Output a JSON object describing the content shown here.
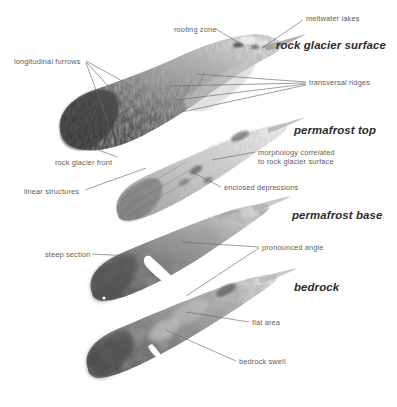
{
  "figure": {
    "width": 397,
    "height": 407,
    "background": "#ffffff",
    "leader_color": "#6b6b6b",
    "annotation_color": "#5d5d5d",
    "title_color": "#2b2b2b"
  },
  "layers": [
    {
      "id": "rock-glacier-surface",
      "label": "rock glacier surface",
      "x": 276,
      "y": 39
    },
    {
      "id": "permafrost-top",
      "label": "permafrost top",
      "x": 294,
      "y": 124
    },
    {
      "id": "permafrost-base",
      "label": "permafrost base",
      "x": 292,
      "y": 209
    },
    {
      "id": "bedrock",
      "label": "bedrock",
      "x": 294,
      "y": 281
    }
  ],
  "annotations": [
    {
      "id": "rooting-zone",
      "label": "rooting zone",
      "x": 174,
      "y": 25
    },
    {
      "id": "meltwater-lakes",
      "label": "meltwater lakes",
      "x": 306,
      "y": 14
    },
    {
      "id": "longitudinal-furrows",
      "label": "longitudinal furrows",
      "x": 14,
      "y": 57
    },
    {
      "id": "transversal-ridges",
      "label": "transversal ridges",
      "x": 309,
      "y": 78
    },
    {
      "id": "rock-glacier-front",
      "label": "rock glacier front",
      "x": 55,
      "y": 158
    },
    {
      "id": "morphology-correlated",
      "label": "morphology correlated",
      "x": 258,
      "y": 148
    },
    {
      "id": "morphology-correlated-line2",
      "label": "to rock glacier surface",
      "x": 258,
      "y": 157
    },
    {
      "id": "linear-structures",
      "label": "linear structures",
      "x": 24,
      "y": 187
    },
    {
      "id": "enclosed-depressions",
      "label": "enclosed depressions",
      "x": 224,
      "y": 183
    },
    {
      "id": "steep-section",
      "label": "steep section",
      "x": 45,
      "y": 250
    },
    {
      "id": "pronounced-angle",
      "label": "pronounced angle",
      "x": 262,
      "y": 243
    },
    {
      "id": "flat-area",
      "label": "flat area",
      "x": 252,
      "y": 318
    },
    {
      "id": "bedrock-swell",
      "label": "bedrock swell",
      "x": 239,
      "y": 357
    }
  ]
}
